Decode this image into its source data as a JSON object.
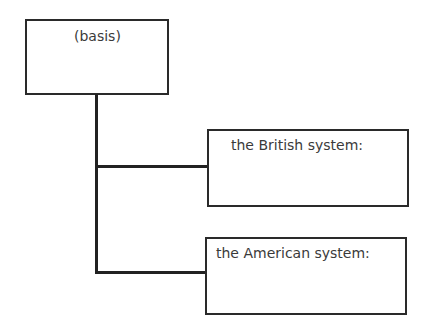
{
  "diagram": {
    "type": "tree",
    "root": {
      "label": "(basis)"
    },
    "children": [
      {
        "label": "the British system:"
      },
      {
        "label": "the American system:"
      }
    ]
  }
}
